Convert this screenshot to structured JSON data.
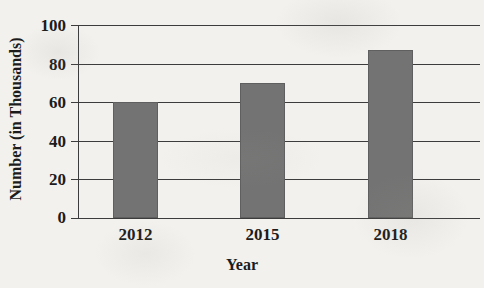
{
  "chart_data": {
    "type": "bar",
    "title": "",
    "categories": [
      "2012",
      "2015",
      "2018"
    ],
    "values": [
      60,
      70,
      87
    ],
    "series": [
      {
        "name": "Number (in Thousands)",
        "values": [
          60,
          70,
          87
        ]
      }
    ],
    "xlabel": "Year",
    "ylabel": "Number (in Thousands)",
    "ylim": [
      0,
      100
    ],
    "yticks": [
      "0",
      "20",
      "40",
      "60",
      "80",
      "100"
    ],
    "ytick_values": [
      0,
      20,
      40,
      60,
      80,
      100
    ],
    "grid": true,
    "legend": false,
    "bar_color": "#737373",
    "axis_color": "#3c3c3c",
    "background_color": "#f2f1ee"
  },
  "axes": {
    "y_title": "Number (in Thousands)",
    "x_title": "Year",
    "y_tick_labels": [
      "100",
      "80",
      "60",
      "40",
      "20",
      "0"
    ],
    "x_tick_labels": [
      "2012",
      "2015",
      "2018"
    ]
  },
  "bleed_text": {
    "top": "",
    "mid": "",
    "low": "",
    "bottom": "",
    "left": ""
  }
}
